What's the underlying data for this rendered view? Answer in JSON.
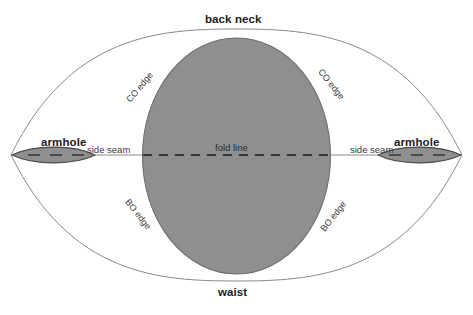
{
  "diagram": {
    "colors": {
      "background": "#ffffff",
      "body_fill": "#8f8f8f",
      "body_stroke": "#6e6e6e",
      "outline_stroke": "#8a8a8a",
      "armhole_fill": "#8f8f8f",
      "armhole_stroke": "#4a4a4a",
      "fold_line": "#1a1a1a",
      "text": "#231f20"
    },
    "labels": {
      "back_neck": "back neck",
      "waist": "waist",
      "armhole_left": "armhole",
      "armhole_right": "armhole",
      "side_seam_left": "side seam",
      "side_seam_right": "side seam",
      "fold_line": "fold line",
      "co_edge_top_left": "CO edge",
      "co_edge_top_right": "CO edge",
      "bo_edge_bottom_left": "BO edge",
      "bo_edge_bottom_right": "BO edge"
    }
  }
}
